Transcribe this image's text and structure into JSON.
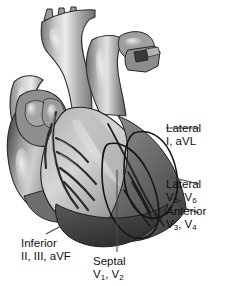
{
  "figure": {
    "background_color": "#ffffff",
    "style": "grayscale anatomical illustration"
  },
  "annotations": [
    {
      "id": "lateral-high",
      "region": "Lateral",
      "leads": "I, aVL",
      "leads_plain": "I, aVL",
      "leader": {
        "from_x": 199,
        "from_y": 128,
        "to_x": 166,
        "to_y": 128
      }
    },
    {
      "id": "lateral-low",
      "region": "Lateral",
      "leads_prefix": "V",
      "lead1_sub": "5",
      "lead_mid": ", V",
      "lead2_sub": "6",
      "leads_plain": "V5, V6",
      "leader": {
        "from_x": 199,
        "from_y": 184,
        "to_x": 172,
        "to_y": 178
      }
    },
    {
      "id": "anterior",
      "region": "Anterior",
      "leads_prefix": "V",
      "lead1_sub": "3",
      "lead_mid": ", V",
      "lead2_sub": "4",
      "leads_plain": "V3, V4",
      "leader": {
        "from_x": 199,
        "from_y": 213,
        "to_x": 174,
        "to_y": 205
      }
    },
    {
      "id": "inferior",
      "region": "Inferior",
      "leads": "II, III, aVF",
      "leads_plain": "II, III, aVF",
      "leader": {
        "from_x": 45,
        "from_y": 234,
        "to_x": 78,
        "to_y": 218
      }
    },
    {
      "id": "septal",
      "region": "Septal",
      "leads_prefix": "V",
      "lead1_sub": "1",
      "lead_mid": ", V",
      "lead2_sub": "2",
      "leads_plain": "V1, V2",
      "leader": {
        "from_x": 117,
        "from_y": 252,
        "to_x": 117,
        "to_y": 170
      }
    }
  ],
  "palette": {
    "outline": "#1a1a1a",
    "leader_line": "#3b3b3b",
    "text": "#101010",
    "tone_lightest": "#d9d9d9",
    "tone_light": "#c4c4c4",
    "tone_mid": "#a6a6a6",
    "tone_midshade": "#8d8d8d",
    "tone_dark": "#6b6b6b",
    "tone_darker": "#4f4f4f",
    "tone_darkest": "#333333",
    "highlight": "#efefef"
  }
}
